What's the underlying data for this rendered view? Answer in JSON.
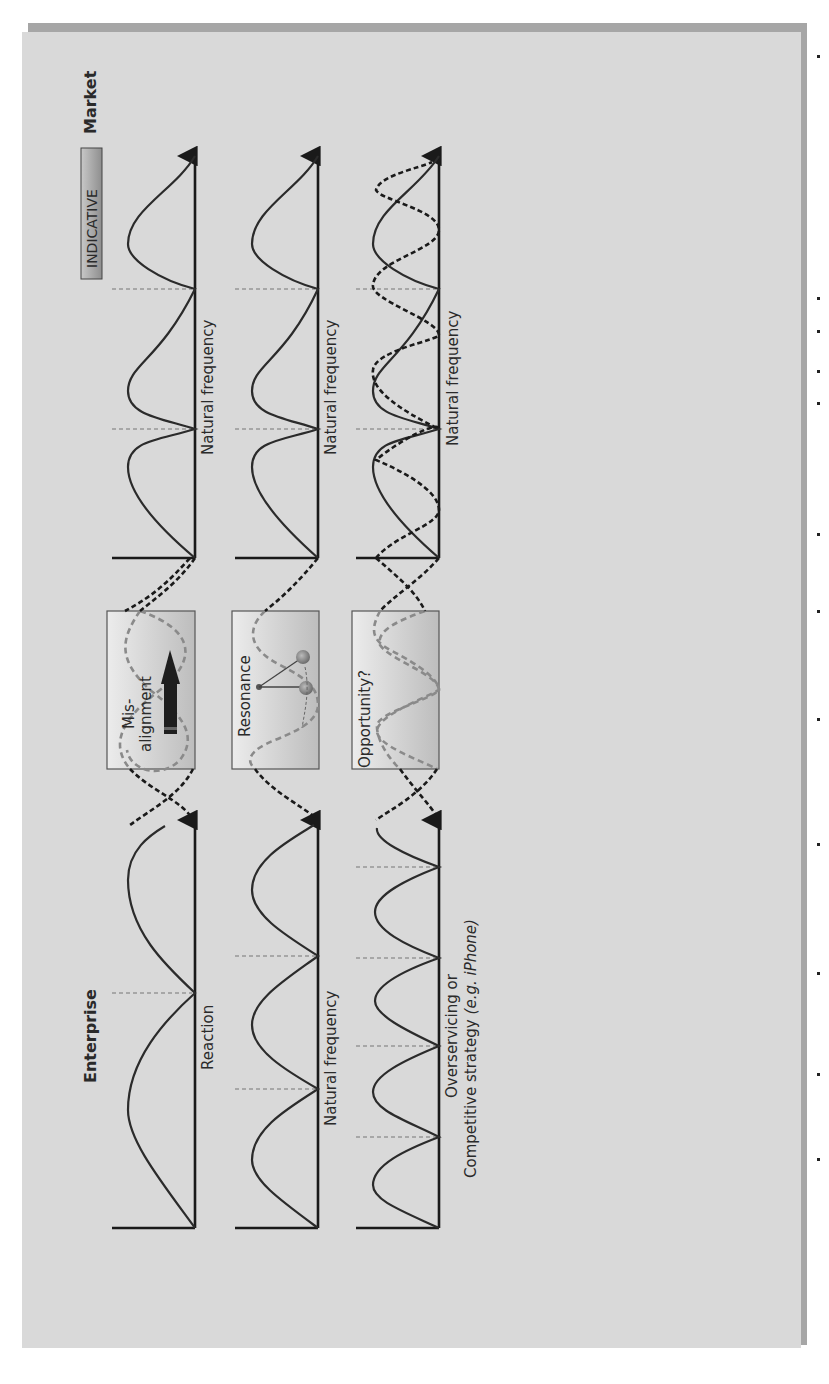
{
  "figure": {
    "badge": "INDICATIVE",
    "column_titles": {
      "enterprise": "Enterprise",
      "market": "Market"
    },
    "rows": [
      {
        "enterprise_label": "Reaction",
        "market_label": "Natural frequency",
        "box_label_line1": "Mis-",
        "box_label_line2": "alignment",
        "box_icon": "up-arrow-icon"
      },
      {
        "enterprise_label": "Natural frequency",
        "market_label": "Natural frequency",
        "box_label": "Resonance",
        "box_icon": "pendulum-icon"
      },
      {
        "enterprise_label_line1": "Overservicing or",
        "enterprise_label_line2": "Competitive strategy",
        "enterprise_label_italic": "(e.g. iPhone)",
        "market_label": "Natural frequency",
        "box_label": "Opportunity?"
      }
    ],
    "colors": {
      "panel": "#d9d9d9",
      "shadow": "#a6a6a6",
      "badge_fill": "#a9a9a9",
      "curve": "#2b2b2b"
    }
  }
}
